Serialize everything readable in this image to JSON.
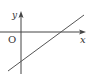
{
  "diagram": {
    "type": "coordinate-plane-line-graph",
    "axes": {
      "x_label": "x",
      "y_label": "y",
      "origin_label": "O"
    },
    "line": {
      "description": "straight line with positive slope, negative y-intercept, positive x-intercept",
      "slope_sign": "positive",
      "y_intercept_sign": "negative",
      "x_intercept_sign": "positive"
    },
    "colors": {
      "axis": "#444444",
      "line": "#555555",
      "background": "#ffffff"
    }
  }
}
